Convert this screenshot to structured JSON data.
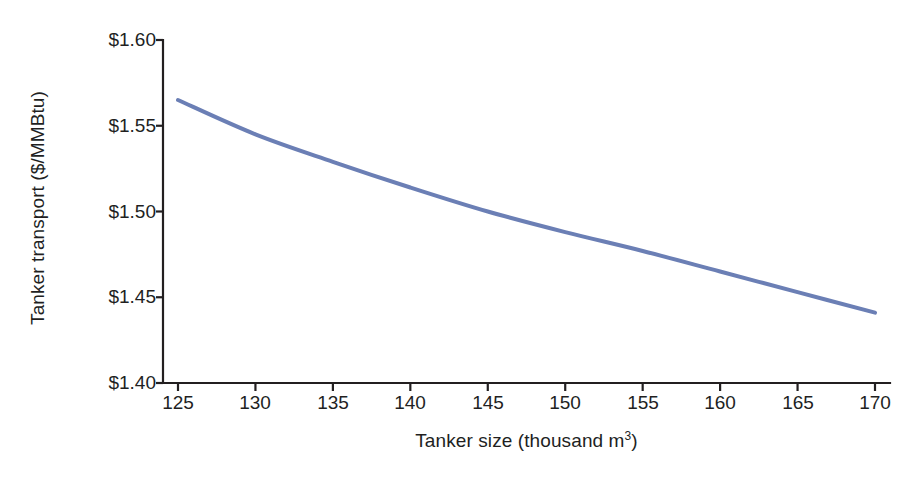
{
  "chart_data": {
    "type": "line",
    "title": "",
    "xlabel": "Tanker size (thousand m",
    "xlabel_sup": "3",
    "xlabel_tail": ")",
    "xlabel_full": "Tanker size (thousand m3)",
    "ylabel": "Tanker transport ($/MMBtu)",
    "x": [
      125,
      130,
      135,
      140,
      145,
      150,
      155,
      160,
      165,
      170
    ],
    "values": [
      1.565,
      1.545,
      1.529,
      1.514,
      1.5,
      1.488,
      1.477,
      1.465,
      1.453,
      1.441
    ],
    "series": [
      {
        "name": "Tanker transport cost",
        "values": [
          1.565,
          1.545,
          1.529,
          1.514,
          1.5,
          1.488,
          1.477,
          1.465,
          1.453,
          1.441
        ]
      }
    ],
    "xlim": [
      125,
      170
    ],
    "ylim": [
      1.4,
      1.6
    ],
    "xticks": [
      125,
      130,
      135,
      140,
      145,
      150,
      155,
      160,
      165,
      170
    ],
    "xtick_labels": [
      "125",
      "130",
      "135",
      "140",
      "145",
      "150",
      "155",
      "160",
      "165",
      "170"
    ],
    "yticks": [
      1.4,
      1.45,
      1.5,
      1.55,
      1.6
    ],
    "ytick_labels": [
      "$1.40",
      "$1.45",
      "$1.50",
      "$1.55",
      "$1.60"
    ],
    "grid": false,
    "legend": false,
    "legend_position": "none",
    "line_color": "#6b7fb5",
    "axis_color": "#231f20",
    "background_color": "#ffffff",
    "line_width": 4
  }
}
